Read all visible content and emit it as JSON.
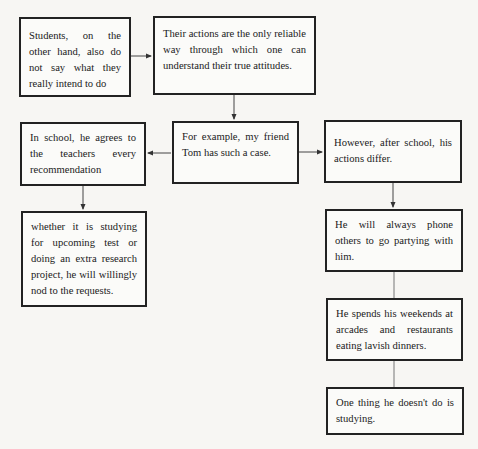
{
  "diagram": {
    "type": "flowchart",
    "nodes": [
      {
        "id": "n1",
        "text": "Students, on the other hand, also do not say what they really intend to do"
      },
      {
        "id": "n2",
        "text": "Their actions are the only reliable way through which one can understand their true attitudes."
      },
      {
        "id": "n3",
        "text": "In school, he agrees to the teachers every recommendation"
      },
      {
        "id": "n4",
        "text": "For example, my friend Tom has such a case."
      },
      {
        "id": "n5",
        "text": "However, after school, his actions differ."
      },
      {
        "id": "n6",
        "text": "whether it is studying for upcoming test or doing an extra research project, he will willingly nod to the requests."
      },
      {
        "id": "n7",
        "text": "He will always phone others to go partying with him."
      },
      {
        "id": "n8",
        "text": "He spends his weekends at arcades and restaurants eating lavish dinners."
      },
      {
        "id": "n9",
        "text": "One thing he doesn't do is studying."
      }
    ],
    "edges": [
      {
        "from": "n1",
        "to": "n2",
        "style": "arrow"
      },
      {
        "from": "n2",
        "to": "n4",
        "style": "arrow"
      },
      {
        "from": "n4",
        "to": "n3",
        "style": "arrow"
      },
      {
        "from": "n4",
        "to": "n5",
        "style": "arrow"
      },
      {
        "from": "n3",
        "to": "n6",
        "style": "arrow"
      },
      {
        "from": "n5",
        "to": "n7",
        "style": "arrow"
      },
      {
        "from": "n7",
        "to": "n8",
        "style": "line"
      },
      {
        "from": "n8",
        "to": "n9",
        "style": "line"
      }
    ]
  }
}
